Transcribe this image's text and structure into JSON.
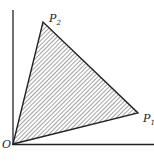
{
  "diagram": {
    "axes": {
      "origin_label": "O",
      "x_axis": {
        "from": [
          13,
          144
        ],
        "to": [
          154,
          144
        ]
      },
      "y_axis": {
        "from": [
          13,
          144
        ],
        "to": [
          13,
          10
        ]
      }
    },
    "points": [
      {
        "id": "O",
        "label": "O",
        "subscript": "",
        "x": 13,
        "y": 144
      },
      {
        "id": "P1",
        "label": "P",
        "subscript": "1",
        "x": 138,
        "y": 113
      },
      {
        "id": "P2",
        "label": "P",
        "subscript": "2",
        "x": 43,
        "y": 22
      }
    ],
    "region": {
      "vertices": [
        "O",
        "P1",
        "P2"
      ],
      "fill": "diagonal hatching",
      "stroke": "#222222"
    },
    "colors": {
      "ink": "#222222",
      "background": "#ffffff"
    }
  }
}
